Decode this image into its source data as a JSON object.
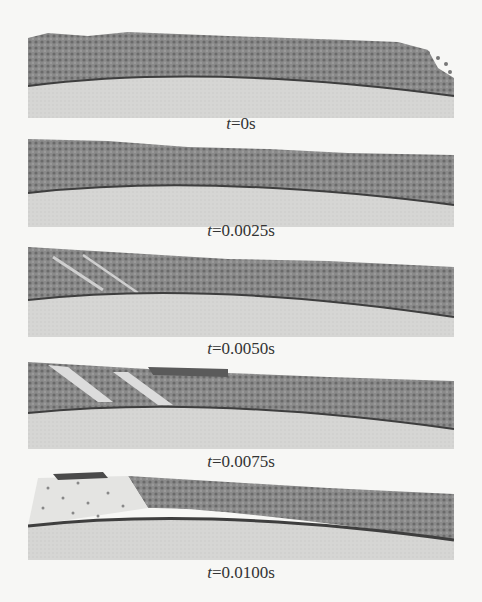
{
  "figure": {
    "panels": [
      {
        "id": "p1",
        "time_var": "t",
        "time_value": "=0s",
        "top": 28,
        "height": 90,
        "label_top": 115
      },
      {
        "id": "p2",
        "time_var": "t",
        "time_value": "=0.0025s",
        "top": 135,
        "height": 92,
        "label_top": 222
      },
      {
        "id": "p3",
        "time_var": "t",
        "time_value": "=0.0050s",
        "top": 245,
        "height": 92,
        "label_top": 340
      },
      {
        "id": "p4",
        "time_var": "t",
        "time_value": "=0.0075s",
        "top": 357,
        "height": 92,
        "label_top": 453
      },
      {
        "id": "p5",
        "time_var": "t",
        "time_value": "=0.0100s",
        "top": 468,
        "height": 92,
        "label_top": 564
      }
    ],
    "colors": {
      "background": "#f7f7f5",
      "particles": "#7a7a7a",
      "particles_dark": "#5a5a5a",
      "surface_line": "#3e3e3e",
      "base": "#d4d4d2"
    }
  }
}
